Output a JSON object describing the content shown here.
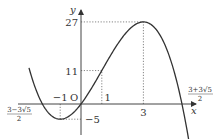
{
  "chart_data": {
    "type": "line",
    "title": "",
    "function": "y = -x^3 + 3x^2 + 9x",
    "xlabel": "x",
    "ylabel": "y",
    "origin_label": "O",
    "x_ticks": [
      {
        "value": -1,
        "label": "−1"
      },
      {
        "value": 1,
        "label": "1"
      },
      {
        "value": 3,
        "label": "3"
      }
    ],
    "y_ticks": [
      {
        "value": 27,
        "label": "27"
      },
      {
        "value": 11,
        "label": "11"
      },
      {
        "value": -5,
        "label": "−5"
      }
    ],
    "root_labels": {
      "left": {
        "value": -1.854,
        "numerator": "3−3√5",
        "denominator": "2"
      },
      "right": {
        "value": 4.854,
        "numerator": "3+3√5",
        "denominator": "2"
      }
    },
    "key_points": [
      {
        "x": -1,
        "y": -5,
        "note": "local minimum"
      },
      {
        "x": 0,
        "y": 0,
        "note": "origin"
      },
      {
        "x": 1,
        "y": 11
      },
      {
        "x": 3,
        "y": 27,
        "note": "local maximum"
      }
    ],
    "series": [
      {
        "name": "f(x)",
        "x": [
          -2.5,
          -2,
          -1.5,
          -1,
          -0.5,
          0,
          0.5,
          1,
          1.5,
          2,
          2.5,
          3,
          3.5,
          4,
          4.5,
          5,
          5.2
        ],
        "values": [
          12.5,
          2,
          -3.375,
          -5,
          -3.625,
          0,
          5.125,
          11,
          17.125,
          22,
          25.625,
          27,
          25.375,
          20,
          10.125,
          -5,
          -10.6
        ]
      }
    ],
    "xlim": [
      -2.5,
      5.2
    ],
    "grid": false,
    "legend": "none",
    "line_color": "#333333",
    "dotted_guides": true
  }
}
